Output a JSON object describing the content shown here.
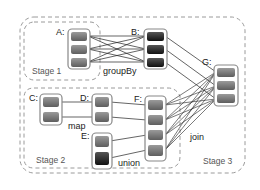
{
  "diagram": {
    "type": "spark-dag-stages",
    "stages": [
      {
        "id": "stage1",
        "label": "Stage 1"
      },
      {
        "id": "stage2",
        "label": "Stage 2"
      },
      {
        "id": "stage3",
        "label": "Stage 3"
      }
    ],
    "rdds": [
      {
        "id": "A",
        "label": "A:",
        "partitions": 3,
        "shade": "medium"
      },
      {
        "id": "B",
        "label": "B:",
        "partitions": 3,
        "shade": "dark"
      },
      {
        "id": "C",
        "label": "C:",
        "partitions": 2,
        "shade": "medium"
      },
      {
        "id": "D",
        "label": "D:",
        "partitions": 2,
        "shade": "medium"
      },
      {
        "id": "E",
        "label": "E:",
        "partitions": 2,
        "shade": "mixed"
      },
      {
        "id": "F",
        "label": "F:",
        "partitions": 4,
        "shade": "medium"
      },
      {
        "id": "G",
        "label": "G:",
        "partitions": 3,
        "shade": "medium"
      }
    ],
    "operations": [
      {
        "id": "groupBy",
        "label": "groupBy",
        "from": [
          "A"
        ],
        "to": "B",
        "dependency": "wide"
      },
      {
        "id": "map",
        "label": "map",
        "from": [
          "C"
        ],
        "to": "D",
        "dependency": "narrow"
      },
      {
        "id": "union",
        "label": "union",
        "from": [
          "D",
          "E"
        ],
        "to": "F",
        "dependency": "narrow"
      },
      {
        "id": "join",
        "label": "join",
        "from": [
          "B",
          "F"
        ],
        "to": "G",
        "dependency": "mixed"
      }
    ],
    "colors": {
      "partition_medium": "#7a7a7a",
      "partition_dark": "#2a2a2a",
      "box_border": "#888888",
      "dashed": "#999999",
      "edge": "#222222"
    }
  }
}
